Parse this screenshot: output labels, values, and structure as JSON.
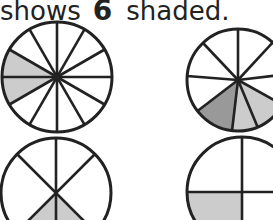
{
  "caption": {
    "prefix": "shows",
    "number": "6",
    "suffix": "shaded."
  },
  "colors": {
    "stroke": "#222222",
    "shade_light": "#cccccc",
    "shade_dark": "#999999"
  },
  "circles": [
    {
      "id": "top-left",
      "sections": 12,
      "shaded": 2
    },
    {
      "id": "top-right",
      "sections": 10,
      "shaded": 3
    },
    {
      "id": "bottom-left",
      "sections": 6,
      "shaded": 1
    },
    {
      "id": "bottom-right",
      "sections": 4,
      "shaded": 1
    }
  ]
}
